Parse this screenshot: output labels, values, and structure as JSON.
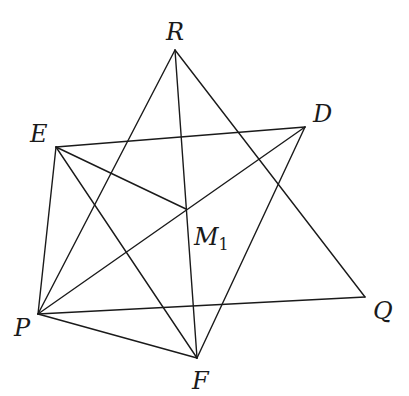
{
  "diagram": {
    "type": "geometric-figure",
    "stroke_color": "#1a1a1a",
    "background": "#ffffff",
    "points": {
      "R": {
        "x": 175,
        "y": 50
      },
      "E": {
        "x": 56,
        "y": 147
      },
      "D": {
        "x": 305,
        "y": 127
      },
      "M1": {
        "x": 186,
        "y": 209
      },
      "P": {
        "x": 38,
        "y": 314
      },
      "Q": {
        "x": 365,
        "y": 297
      },
      "F": {
        "x": 197,
        "y": 358
      }
    },
    "segments": [
      [
        "E",
        "D"
      ],
      [
        "E",
        "P"
      ],
      [
        "E",
        "F"
      ],
      [
        "E",
        "M1"
      ],
      [
        "R",
        "P"
      ],
      [
        "R",
        "F"
      ],
      [
        "R",
        "Q"
      ],
      [
        "P",
        "D"
      ],
      [
        "P",
        "Q"
      ],
      [
        "P",
        "F"
      ],
      [
        "D",
        "F"
      ]
    ],
    "labels": {
      "R": {
        "text": "R",
        "x": 166,
        "y": 40
      },
      "E": {
        "text": "E",
        "x": 30,
        "y": 142
      },
      "D": {
        "text": "D",
        "x": 313,
        "y": 122
      },
      "M1": {
        "text": "M",
        "sub": "1",
        "x": 194,
        "y": 245
      },
      "P": {
        "text": "P",
        "x": 14,
        "y": 336
      },
      "Q": {
        "text": "Q",
        "x": 373,
        "y": 319
      },
      "F": {
        "text": "F",
        "x": 192,
        "y": 389
      }
    }
  }
}
